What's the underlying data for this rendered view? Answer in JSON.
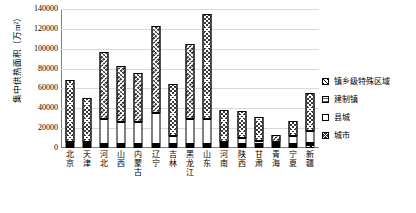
{
  "chart_data": {
    "type": "bar",
    "title": "",
    "subtitle": "",
    "xlabel": "",
    "ylabel": "集中供热面积（万m²）",
    "ylim": [
      0,
      140000
    ],
    "ytick_step": 20000,
    "yticks": [
      "0",
      "20000",
      "40000",
      "60000",
      "80000",
      "100000",
      "120000",
      "140000"
    ],
    "grid": true,
    "stacked": true,
    "legend_position": "right",
    "categories": [
      "北京",
      "天津",
      "河北",
      "山西",
      "内蒙古",
      "辽宁",
      "吉林",
      "黑龙江",
      "山东",
      "河南",
      "陕西",
      "甘肃",
      "青海",
      "宁夏",
      "新疆"
    ],
    "series": [
      {
        "name": "城市",
        "pattern": "city",
        "values": [
          62000,
          44000,
          68000,
          57000,
          50000,
          88000,
          52000,
          76000,
          105000,
          32000,
          27000,
          24000,
          7500,
          15000,
          38000
        ]
      },
      {
        "name": "县城",
        "pattern": "county",
        "values": [
          1500,
          500,
          25000,
          22000,
          22000,
          31000,
          8000,
          25000,
          25000,
          1000,
          6000,
          3500,
          500,
          8000,
          12000
        ]
      },
      {
        "name": "建制镇",
        "pattern": "town",
        "values": [
          500,
          300,
          2000,
          1200,
          1500,
          1500,
          800,
          2000,
          2500,
          500,
          1000,
          800,
          200,
          1000,
          1500
        ]
      },
      {
        "name": "镇乡级特殊区域",
        "pattern": "special",
        "values": [
          300,
          200,
          800,
          400,
          500,
          600,
          300,
          1000,
          800,
          200,
          2500,
          300,
          100,
          300,
          3500
        ]
      }
    ]
  },
  "legend": {
    "items": [
      {
        "label": "镇乡级特殊区域",
        "pattern": "special"
      },
      {
        "label": "建制镇",
        "pattern": "town"
      },
      {
        "label": "县城",
        "pattern": "county"
      },
      {
        "label": "城市",
        "pattern": "city"
      }
    ]
  }
}
